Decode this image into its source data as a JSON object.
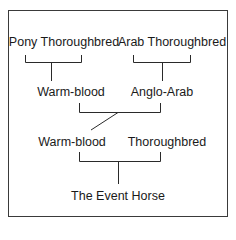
{
  "diagram": {
    "type": "pedigree-tree",
    "nodes": {
      "pony_thoroughbred": "Pony Thoroughbred",
      "arab_thoroughbred": "Arab Thoroughbred",
      "warm_blood_1": "Warm-blood",
      "anglo_arab": "Anglo-Arab",
      "warm_blood_2": "Warm-blood",
      "thoroughbred": "Thoroughbred",
      "event_horse": "The Event Horse"
    },
    "edges": [
      [
        "pony_thoroughbred",
        "warm_blood_1"
      ],
      [
        "arab_thoroughbred",
        "anglo_arab"
      ],
      [
        "warm_blood_1",
        "warm_blood_2"
      ],
      [
        "anglo_arab",
        "warm_blood_2"
      ],
      [
        "warm_blood_2",
        "event_horse"
      ],
      [
        "thoroughbred",
        "event_horse"
      ]
    ],
    "colors": {
      "line": "#2a2a2a",
      "text": "#1a1a1a",
      "background": "#ffffff"
    }
  }
}
